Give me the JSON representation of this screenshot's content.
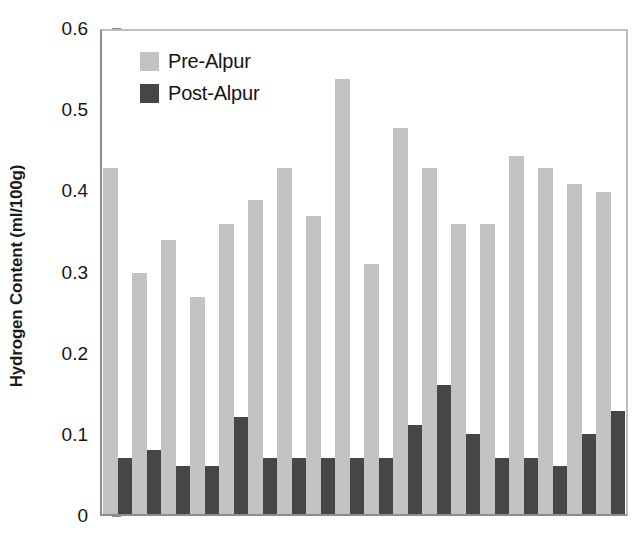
{
  "chart_data": {
    "type": "bar",
    "title": "",
    "subtitle": "",
    "xlabel": "",
    "ylabel": "Hydrogen Content (ml/100g)",
    "ylim": [
      0,
      0.6
    ],
    "yticks": [
      "0",
      "0.1",
      "0.2",
      "0.3",
      "0.4",
      "0.5",
      "0.6"
    ],
    "ytick_values": [
      0,
      0.1,
      0.2,
      0.3,
      0.4,
      0.5,
      0.6
    ],
    "xtick_labels": [],
    "grid": false,
    "legend_position": "upper-left-inside",
    "categories": [
      "1",
      "2",
      "3",
      "4",
      "5",
      "6",
      "7",
      "8",
      "9",
      "10",
      "11",
      "12",
      "13",
      "14",
      "15",
      "16",
      "17",
      "18"
    ],
    "series": [
      {
        "name": "Pre-Alpur",
        "color": "#c3c3c3",
        "values": [
          0.43,
          0.3,
          0.34,
          0.27,
          0.36,
          0.39,
          0.43,
          0.37,
          0.54,
          0.31,
          0.48,
          0.43,
          0.36,
          0.36,
          0.445,
          0.43,
          0.41,
          0.4
        ]
      },
      {
        "name": "Post-Alpur",
        "color": "#464646",
        "values": [
          0.07,
          0.08,
          0.06,
          0.06,
          0.12,
          0.07,
          0.07,
          0.07,
          0.07,
          0.07,
          0.11,
          0.16,
          0.1,
          0.07,
          0.07,
          0.06,
          0.1,
          0.128
        ]
      }
    ]
  },
  "legend": {
    "items": [
      {
        "label": "Pre-Alpur",
        "swatch": "pre"
      },
      {
        "label": "Post-Alpur",
        "swatch": "post"
      }
    ]
  },
  "axis": {
    "y_title": "Hydrogen Content (ml/100g)"
  }
}
